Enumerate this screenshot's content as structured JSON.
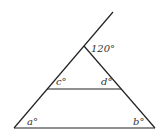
{
  "diagram": {
    "type": "geometry-triangle",
    "labels": {
      "apex_exterior": "120°",
      "c": "c°",
      "d": "d°",
      "a": "a°",
      "b": "b°"
    },
    "colors": {
      "stroke": "#222222",
      "text": "#333333",
      "background": "#ffffff"
    }
  }
}
